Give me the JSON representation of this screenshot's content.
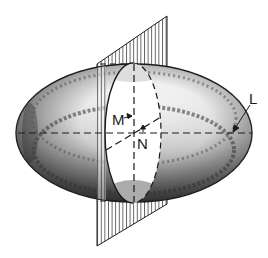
{
  "figure": {
    "labels": {
      "m": "M",
      "n": "N",
      "l": "L"
    },
    "colors": {
      "ink": "#1a1a1a",
      "background": "#ffffff",
      "shade": "#3a3a3a"
    }
  }
}
